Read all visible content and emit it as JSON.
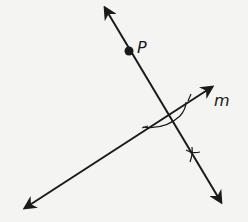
{
  "figure": {
    "labels": {
      "point": "P",
      "line": "m"
    },
    "colors": {
      "background": "#f4f4f2",
      "ink": "#1a1a1a"
    }
  }
}
